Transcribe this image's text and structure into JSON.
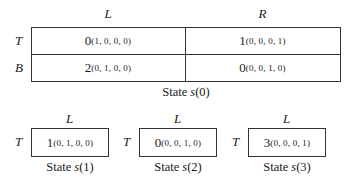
{
  "game": {
    "main_state": {
      "caption_prefix": "State ",
      "caption_var": "s",
      "caption_index": "(0)",
      "columns": [
        "L",
        "R"
      ],
      "rows": [
        "T",
        "B"
      ],
      "cells": [
        [
          {
            "payoff": "0",
            "transition": "(1, 0, 0, 0)"
          },
          {
            "payoff": "1",
            "transition": "(0, 0, 0, 1)"
          }
        ],
        [
          {
            "payoff": "2",
            "transition": "(0, 1, 0, 0)"
          },
          {
            "payoff": "0",
            "transition": "(0, 0, 1, 0)"
          }
        ]
      ]
    },
    "absorbing_states": [
      {
        "column": "L",
        "row": "T",
        "payoff": "1",
        "transition": "(0, 1, 0, 0)",
        "caption_prefix": "State ",
        "caption_var": "s",
        "caption_index": "(1)"
      },
      {
        "column": "L",
        "row": "T",
        "payoff": "0",
        "transition": "(0, 0, 1, 0)",
        "caption_prefix": "State ",
        "caption_var": "s",
        "caption_index": "(2)"
      },
      {
        "column": "L",
        "row": "T",
        "payoff": "3",
        "transition": "(0, 0, 0, 1)",
        "caption_prefix": "State ",
        "caption_var": "s",
        "caption_index": "(3)"
      }
    ]
  }
}
